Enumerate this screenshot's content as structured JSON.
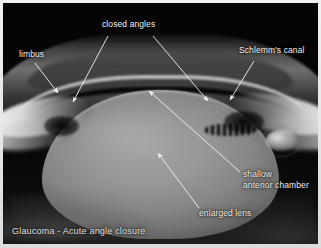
{
  "figure": {
    "caption": "Glaucoma - Acute angle closure",
    "frame_color": "#e9e9e9",
    "background_color": "#030303",
    "annotation_color": "#f2f2f2",
    "width": 321,
    "height": 248
  },
  "annotations": [
    {
      "id": "limbus",
      "label": "limbus",
      "lines": [
        "limbus"
      ],
      "label_x": 16,
      "label_y": 52,
      "leader": {
        "x1": 36,
        "y1": 63,
        "x2": 58,
        "y2": 93
      }
    },
    {
      "id": "closed-angles",
      "label": "closed angles",
      "lines": [
        "closed angles"
      ],
      "label_x": 104,
      "label_y": 22,
      "leader_left": {
        "x1": 108,
        "y1": 36,
        "x2": 72,
        "y2": 102
      },
      "leader_right": {
        "x1": 152,
        "y1": 36,
        "x2": 207,
        "y2": 101
      }
    },
    {
      "id": "schlemms-canal",
      "label": "Schlemm's canal",
      "lines": [
        "Schlemm's canal"
      ],
      "label_x": 243,
      "label_y": 48,
      "leader": {
        "x1": 254,
        "y1": 61,
        "x2": 229,
        "y2": 100
      }
    },
    {
      "id": "shallow-anterior-chamber",
      "label": "shallow anterior chamber",
      "lines": [
        "shallow",
        "anterior chamber"
      ],
      "label_x": 243,
      "label_y": 172,
      "leader": {
        "x1": 240,
        "y1": 172,
        "x2": 148,
        "y2": 90
      }
    },
    {
      "id": "enlarged-lens",
      "label": "enlarged lens",
      "lines": [
        "enlarged lens"
      ],
      "label_x": 200,
      "label_y": 209,
      "leader": {
        "x1": 198,
        "y1": 208,
        "x2": 157,
        "y2": 152
      }
    }
  ],
  "anatomy": [
    {
      "id": "cornea",
      "name": "cornea"
    },
    {
      "id": "lens",
      "name": "enlarged lens"
    },
    {
      "id": "sclera-left",
      "name": "left sclera and limbus"
    },
    {
      "id": "sclera-right",
      "name": "right sclera and limbus"
    },
    {
      "id": "schlemm",
      "name": "Schlemm's canal lumen"
    },
    {
      "id": "angle-left",
      "name": "left closed angle"
    },
    {
      "id": "angle-right",
      "name": "right closed angle"
    },
    {
      "id": "chamber-slit",
      "name": "shallow anterior chamber"
    }
  ]
}
